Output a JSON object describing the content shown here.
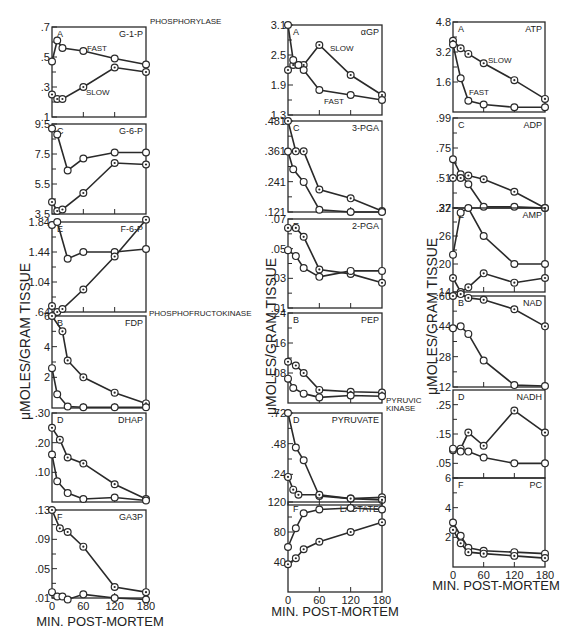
{
  "figure": {
    "xlabel": "MIN. POST-MORTEM",
    "ylabel": "μMOLES/GRAM TISSUE",
    "x_ticks": [
      "0",
      "60",
      "120",
      "180"
    ],
    "annotations": {
      "phosphorylase": "PHOSPHORYLASE",
      "phosphofructokinase": "PHOSPHOFRUCTOKINASE",
      "pyruvic_kinase_1": "PYRUVIC",
      "pyruvic_kinase_2": "KINASE"
    },
    "series_labels": {
      "fast": "FAST",
      "slow": "SLOW"
    }
  },
  "chart_data": [
    {
      "id": "g1p",
      "type": "line",
      "letter": "A",
      "title": "G-1-P",
      "ylim": [
        0.1,
        0.7
      ],
      "yticks": [
        ".7",
        ".5",
        ".3",
        ".1"
      ],
      "ytick_values": [
        0.7,
        0.5,
        0.3,
        0.1
      ],
      "x": [
        0,
        10,
        20,
        30,
        60,
        120,
        180
      ],
      "series": [
        {
          "name": "FAST",
          "x": [
            0,
            10,
            20,
            60,
            120,
            180
          ],
          "values": [
            0.47,
            0.61,
            0.56,
            0.54,
            0.49,
            0.45
          ]
        },
        {
          "name": "SLOW",
          "x": [
            0,
            10,
            20,
            60,
            120,
            180
          ],
          "values": [
            0.25,
            0.22,
            0.22,
            0.3,
            0.43,
            0.4
          ]
        }
      ]
    },
    {
      "id": "g6p",
      "type": "line",
      "letter": "C",
      "title": "G-6-P",
      "ylim": [
        3.5,
        9.5
      ],
      "yticks": [
        "9.5",
        "7.5",
        "5.5",
        "3.5"
      ],
      "ytick_values": [
        9.5,
        7.5,
        5.5,
        3.5
      ],
      "series": [
        {
          "name": "FAST",
          "x": [
            0,
            10,
            30,
            60,
            120,
            180
          ],
          "values": [
            9.2,
            8.8,
            6.4,
            7.2,
            7.6,
            7.6
          ]
        },
        {
          "name": "SLOW",
          "x": [
            0,
            10,
            20,
            60,
            120,
            180
          ],
          "values": [
            4.3,
            3.7,
            3.8,
            4.9,
            6.9,
            6.8
          ]
        }
      ]
    },
    {
      "id": "f6p",
      "type": "line",
      "letter": "E",
      "title": "F-6-P",
      "ylim": [
        0.64,
        1.84
      ],
      "yticks": [
        "1.84",
        "1.44",
        "1.04",
        ".64"
      ],
      "ytick_values": [
        1.84,
        1.44,
        1.04,
        0.64
      ],
      "series": [
        {
          "name": "FAST",
          "x": [
            0,
            10,
            30,
            60,
            120,
            180
          ],
          "values": [
            1.8,
            1.84,
            1.35,
            1.44,
            1.44,
            1.48
          ]
        },
        {
          "name": "SLOW",
          "x": [
            0,
            10,
            20,
            60,
            120,
            180
          ],
          "values": [
            0.72,
            0.64,
            0.68,
            0.94,
            1.38,
            1.87
          ]
        }
      ]
    },
    {
      "id": "fdp",
      "type": "line",
      "letter": "B",
      "title": "FDP",
      "ylim": [
        0,
        6
      ],
      "yticks": [
        "6",
        "4",
        "2"
      ],
      "ytick_values": [
        6,
        4,
        2
      ],
      "series": [
        {
          "name": "SLOW",
          "x": [
            0,
            20,
            30,
            60,
            120,
            180
          ],
          "values": [
            6.0,
            5.0,
            3.1,
            2.0,
            1.0,
            0.3
          ]
        },
        {
          "name": "FAST",
          "x": [
            0,
            10,
            30,
            60,
            120,
            180
          ],
          "values": [
            2.6,
            0.9,
            0.1,
            0.05,
            0.05,
            0.05
          ]
        }
      ]
    },
    {
      "id": "dhap",
      "type": "line",
      "letter": "D",
      "title": "DHAP",
      "ylim": [
        0,
        0.3
      ],
      "yticks": [
        ".30",
        ".20",
        ".10"
      ],
      "ytick_values": [
        0.3,
        0.2,
        0.1
      ],
      "series": [
        {
          "name": "SLOW",
          "x": [
            0,
            15,
            30,
            60,
            120,
            180
          ],
          "values": [
            0.25,
            0.21,
            0.15,
            0.13,
            0.06,
            0.01
          ]
        },
        {
          "name": "FAST",
          "x": [
            0,
            10,
            30,
            60,
            120,
            180
          ],
          "values": [
            0.16,
            0.07,
            0.03,
            0.01,
            0.015,
            0.005
          ]
        }
      ]
    },
    {
      "id": "ga3p",
      "type": "line",
      "letter": "F",
      "title": "GA3P",
      "ylim": [
        0.01,
        0.13
      ],
      "yticks": [
        ".13",
        ".09",
        ".05",
        ".01"
      ],
      "ytick_values": [
        0.13,
        0.09,
        0.05,
        0.01
      ],
      "series": [
        {
          "name": "SLOW",
          "x": [
            0,
            15,
            30,
            60,
            120,
            180
          ],
          "values": [
            0.13,
            0.105,
            0.1,
            0.08,
            0.025,
            0.018
          ]
        },
        {
          "name": "FAST",
          "x": [
            0,
            10,
            20,
            30,
            60,
            120,
            180
          ],
          "values": [
            0.018,
            0.012,
            0.012,
            0.008,
            0.015,
            0.01,
            0.008
          ]
        }
      ]
    },
    {
      "id": "agp",
      "type": "line",
      "letter": "A",
      "title": "αGP",
      "ylim": [
        1.3,
        3.1
      ],
      "yticks": [
        "3.1",
        "2.5",
        "1.9",
        "1.3"
      ],
      "ytick_values": [
        3.1,
        2.5,
        1.9,
        1.3
      ],
      "series": [
        {
          "name": "SLOW",
          "x": [
            0,
            10,
            20,
            30,
            60,
            120,
            180
          ],
          "values": [
            2.2,
            2.3,
            2.3,
            2.3,
            2.7,
            2.1,
            1.7
          ]
        },
        {
          "name": "FAST",
          "x": [
            0,
            10,
            20,
            30,
            60,
            120,
            180
          ],
          "values": [
            3.1,
            2.4,
            2.3,
            2.2,
            1.8,
            1.7,
            1.6
          ]
        }
      ]
    },
    {
      "id": "pga3",
      "type": "line",
      "letter": "C",
      "title": "3-PGA",
      "ylim": [
        0.121,
        0.481
      ],
      "yticks": [
        ".481",
        ".361",
        ".241",
        ".121"
      ],
      "ytick_values": [
        0.481,
        0.361,
        0.241,
        0.121
      ],
      "series": [
        {
          "name": "SLOW",
          "x": [
            0,
            15,
            30,
            60,
            120,
            180
          ],
          "values": [
            0.481,
            0.361,
            0.361,
            0.21,
            0.175,
            0.125
          ]
        },
        {
          "name": "FAST",
          "x": [
            0,
            10,
            30,
            60,
            120,
            180
          ],
          "values": [
            0.36,
            0.29,
            0.24,
            0.13,
            0.121,
            0.121
          ]
        }
      ]
    },
    {
      "id": "pga2",
      "type": "line",
      "letter": "E",
      "title": "2-PGA",
      "ylim": [
        0.01,
        0.07
      ],
      "yticks": [
        ".07",
        ".05",
        ".03",
        ".01"
      ],
      "ytick_values": [
        0.07,
        0.05,
        0.03,
        0.01
      ],
      "series": [
        {
          "name": "SLOW",
          "x": [
            0,
            15,
            30,
            60,
            120,
            180
          ],
          "values": [
            0.064,
            0.064,
            0.058,
            0.036,
            0.033,
            0.027
          ]
        },
        {
          "name": "FAST",
          "x": [
            0,
            15,
            30,
            60,
            120,
            180
          ],
          "values": [
            0.049,
            0.045,
            0.037,
            0.031,
            0.035,
            0.035
          ]
        }
      ]
    },
    {
      "id": "pep",
      "type": "line",
      "letter": "B",
      "title": "PEP",
      "ylim": [
        0,
        0.24
      ],
      "yticks": [
        ".24",
        ".16",
        ".08"
      ],
      "ytick_values": [
        0.24,
        0.16,
        0.08
      ],
      "series": [
        {
          "name": "SLOW",
          "x": [
            0,
            15,
            30,
            60,
            120,
            180
          ],
          "values": [
            0.11,
            0.1,
            0.08,
            0.035,
            0.03,
            0.028
          ]
        },
        {
          "name": "FAST",
          "x": [
            0,
            10,
            30,
            60,
            120,
            180
          ],
          "values": [
            0.065,
            0.04,
            0.025,
            0.015,
            0.02,
            0.018
          ]
        }
      ]
    },
    {
      "id": "pyruvate",
      "type": "line",
      "letter": "D",
      "title": "PYRUVATE",
      "ylim": [
        0,
        0.72
      ],
      "yticks": [
        ".72",
        ".48",
        ".24"
      ],
      "ytick_values": [
        0.72,
        0.48,
        0.24
      ],
      "series": [
        {
          "name": "FAST",
          "x": [
            0,
            15,
            30,
            60,
            120,
            180
          ],
          "values": [
            0.72,
            0.45,
            0.35,
            0.07,
            0.05,
            0.06
          ]
        },
        {
          "name": "SLOW",
          "x": [
            0,
            10,
            20,
            60,
            120,
            180
          ],
          "values": [
            0.22,
            0.12,
            0.08,
            0.08,
            0.05,
            0.04
          ]
        }
      ]
    },
    {
      "id": "lactate",
      "type": "line",
      "letter": "F",
      "title": "LACTATE",
      "ylim": [
        0,
        120
      ],
      "yticks": [
        "120",
        "80",
        "40"
      ],
      "ytick_values": [
        120,
        80,
        40
      ],
      "series": [
        {
          "name": "FAST",
          "x": [
            0,
            15,
            30,
            60,
            120,
            180
          ],
          "values": [
            60,
            85,
            105,
            110,
            112,
            110
          ]
        },
        {
          "name": "SLOW",
          "x": [
            0,
            15,
            30,
            60,
            120,
            180
          ],
          "values": [
            37,
            45,
            57,
            67,
            80,
            93
          ]
        }
      ]
    },
    {
      "id": "atp",
      "type": "line",
      "letter": "A",
      "title": "ATP",
      "ylim": [
        0,
        4.8
      ],
      "yticks": [
        "4.8",
        "3.2",
        "1.6"
      ],
      "ytick_values": [
        4.8,
        3.2,
        1.6
      ],
      "series": [
        {
          "name": "SLOW",
          "x": [
            0,
            15,
            30,
            60,
            120,
            180
          ],
          "values": [
            3.8,
            3.4,
            3.1,
            2.6,
            1.7,
            0.7
          ]
        },
        {
          "name": "FAST",
          "x": [
            0,
            15,
            30,
            60,
            120,
            180
          ],
          "values": [
            3.6,
            1.8,
            0.6,
            0.4,
            0.25,
            0.25
          ]
        }
      ]
    },
    {
      "id": "adp",
      "type": "line",
      "letter": "C",
      "title": "ADP",
      "ylim": [
        0.27,
        0.99
      ],
      "yticks": [
        ".99",
        ".75",
        ".51",
        ".27"
      ],
      "ytick_values": [
        0.99,
        0.75,
        0.51,
        0.27
      ],
      "series": [
        {
          "name": "FAST",
          "x": [
            0,
            15,
            30,
            60,
            120,
            180
          ],
          "values": [
            0.66,
            0.54,
            0.46,
            0.28,
            0.28,
            0.27
          ]
        },
        {
          "name": "SLOW",
          "x": [
            0,
            15,
            30,
            60,
            120,
            180
          ],
          "values": [
            0.51,
            0.51,
            0.53,
            0.5,
            0.4,
            0.27
          ]
        }
      ]
    },
    {
      "id": "amp",
      "type": "line",
      "letter": "E",
      "title": "AMP",
      "ylim": [
        0.14,
        0.32
      ],
      "yticks": [
        ".32",
        ".26",
        ".20",
        ".14"
      ],
      "ytick_values": [
        0.32,
        0.26,
        0.2,
        0.14
      ],
      "series": [
        {
          "name": "FAST",
          "x": [
            0,
            15,
            30,
            60,
            120,
            180
          ],
          "values": [
            0.22,
            0.31,
            0.32,
            0.26,
            0.2,
            0.2
          ]
        },
        {
          "name": "SLOW",
          "x": [
            0,
            15,
            30,
            60,
            120,
            180
          ],
          "values": [
            0.17,
            0.14,
            0.15,
            0.18,
            0.16,
            0.17
          ]
        }
      ]
    },
    {
      "id": "nad",
      "type": "line",
      "letter": "B",
      "title": "NAD",
      "ylim": [
        0.12,
        0.6
      ],
      "yticks": [
        ".60",
        ".44",
        ".28",
        ".12"
      ],
      "ytick_values": [
        0.6,
        0.44,
        0.28,
        0.12
      ],
      "series": [
        {
          "name": "SLOW",
          "x": [
            0,
            15,
            30,
            60,
            120,
            180
          ],
          "values": [
            0.6,
            0.61,
            0.59,
            0.58,
            0.53,
            0.44
          ]
        },
        {
          "name": "FAST",
          "x": [
            0,
            15,
            30,
            60,
            120,
            180
          ],
          "values": [
            0.43,
            0.44,
            0.4,
            0.26,
            0.13,
            0.125
          ]
        }
      ]
    },
    {
      "id": "nadh",
      "type": "line",
      "letter": "D",
      "title": "NADH",
      "ylim": [
        0,
        0.3
      ],
      "yticks": [
        ".25",
        ".15",
        ".05"
      ],
      "ytick_values": [
        0.25,
        0.15,
        0.05
      ],
      "series": [
        {
          "name": "SLOW",
          "x": [
            0,
            15,
            30,
            60,
            120,
            180
          ],
          "values": [
            0.095,
            0.1,
            0.155,
            0.11,
            0.23,
            0.155
          ]
        },
        {
          "name": "FAST",
          "x": [
            0,
            15,
            30,
            60,
            120,
            180
          ],
          "values": [
            0.1,
            0.09,
            0.09,
            0.07,
            0.05,
            0.05
          ]
        }
      ]
    },
    {
      "id": "pc",
      "type": "line",
      "letter": "F",
      "title": "PC",
      "ylim": [
        0,
        6
      ],
      "yticks": [
        "6",
        "4",
        "2"
      ],
      "ytick_values": [
        6,
        4,
        2
      ],
      "series": [
        {
          "name": "FAST",
          "x": [
            0,
            15,
            30,
            60,
            120,
            180
          ],
          "values": [
            3.0,
            2.1,
            1.3,
            1.1,
            1.0,
            0.9
          ]
        },
        {
          "name": "SLOW",
          "x": [
            0,
            15,
            30,
            60,
            120,
            180
          ],
          "values": [
            2.5,
            1.6,
            1.0,
            0.9,
            0.75,
            0.6
          ]
        }
      ]
    }
  ]
}
